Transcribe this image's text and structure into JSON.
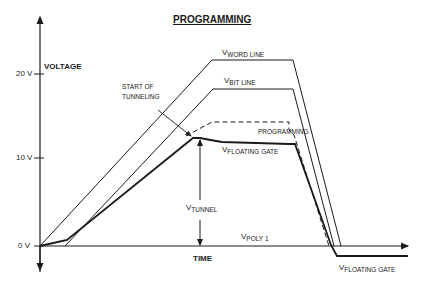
{
  "title": "PROGRAMMING",
  "axes": {
    "y_label": "VOLTAGE",
    "x_label": "TIME",
    "y_ticks": [
      "20 V",
      "10 V",
      "0 V"
    ]
  },
  "curves": {
    "word_line": {
      "v": "V",
      "sub": "WORD LINE"
    },
    "bit_line": {
      "v": "V",
      "sub": "BIT LINE"
    },
    "programming": "PROGRAMMING",
    "floating_gate_top": {
      "v": "V",
      "sub": "FLOATING GATE"
    },
    "floating_gate_bottom": {
      "v": "V",
      "sub": "FLOATING GATE"
    },
    "poly1": {
      "v": "V",
      "sub": "POLY 1"
    },
    "tunnel": {
      "v": "V",
      "sub": "TUNNEL"
    }
  },
  "annotations": {
    "start_line1": "START OF",
    "start_line2": "TUNNELING"
  },
  "colors": {
    "ink": "#1a1a1a",
    "background": "#ffffff"
  }
}
